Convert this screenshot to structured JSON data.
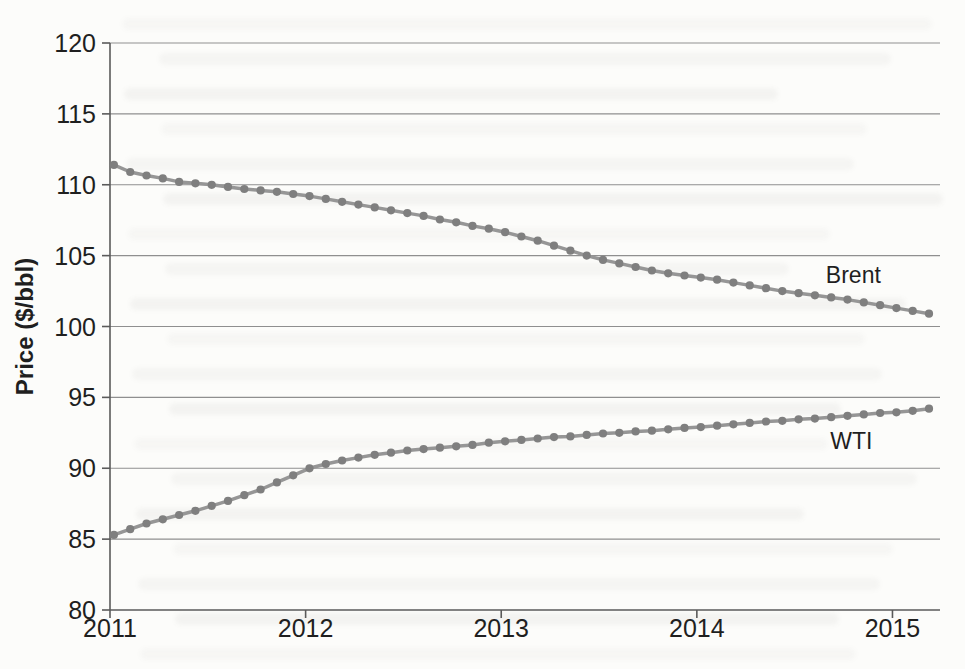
{
  "figure": {
    "kind": "scanned-book-figure",
    "title": "",
    "background_color": "#fcfcfa"
  },
  "chart_data": {
    "type": "line",
    "title": "",
    "xlabel": "",
    "ylabel": "Price ($/bbl)",
    "xlim": [
      2011,
      2015.243
    ],
    "ylim": [
      80,
      120
    ],
    "x_ticks": [
      2011,
      2012,
      2013,
      2014,
      2015
    ],
    "y_ticks": [
      80,
      85,
      90,
      95,
      100,
      105,
      110,
      115,
      120
    ],
    "grid": "horizontal-only",
    "legend_position": "inline-labels-on-plot",
    "x_start": 2011.02,
    "x_step": 0.0833333,
    "x_unit": "year (monthly points, Jan 2011 - Mar 2015)",
    "colors": {
      "line": "#969696",
      "marker": "#7f7f7f",
      "text": "#1f1f1f",
      "grid": "#8f8f8f",
      "axis": "#5a5a5a"
    },
    "series": [
      {
        "name": "Brent",
        "marker": "circle",
        "label_anchor": {
          "x": 2014.8,
          "y": 103.6
        },
        "values": [
          111.4,
          110.9,
          110.65,
          110.45,
          110.2,
          110.1,
          110.0,
          109.85,
          109.7,
          109.6,
          109.5,
          109.35,
          109.2,
          109.0,
          108.8,
          108.6,
          108.4,
          108.2,
          108.0,
          107.8,
          107.55,
          107.35,
          107.1,
          106.9,
          106.65,
          106.35,
          106.05,
          105.7,
          105.35,
          105.0,
          104.7,
          104.45,
          104.2,
          103.95,
          103.75,
          103.6,
          103.45,
          103.3,
          103.1,
          102.9,
          102.7,
          102.5,
          102.35,
          102.2,
          102.05,
          101.9,
          101.7,
          101.5,
          101.3,
          101.1,
          100.9
        ]
      },
      {
        "name": "WTI",
        "marker": "circle",
        "label_anchor": {
          "x": 2014.79,
          "y": 91.9
        },
        "values": [
          85.3,
          85.7,
          86.1,
          86.4,
          86.7,
          87.0,
          87.35,
          87.7,
          88.1,
          88.5,
          89.0,
          89.5,
          90.0,
          90.3,
          90.55,
          90.75,
          90.95,
          91.1,
          91.25,
          91.35,
          91.45,
          91.55,
          91.65,
          91.8,
          91.9,
          92.0,
          92.1,
          92.2,
          92.25,
          92.35,
          92.45,
          92.5,
          92.6,
          92.65,
          92.75,
          92.85,
          92.9,
          93.0,
          93.1,
          93.2,
          93.3,
          93.35,
          93.45,
          93.5,
          93.6,
          93.7,
          93.8,
          93.9,
          93.95,
          94.05,
          94.2
        ]
      }
    ]
  }
}
